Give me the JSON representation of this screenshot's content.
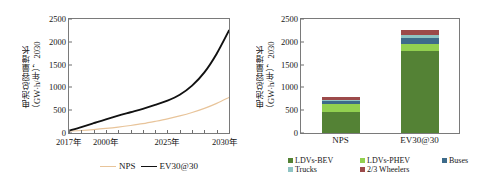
{
  "chart_data": [
    {
      "type": "line",
      "panel": "left",
      "title": "",
      "ylabel_line1": "电池总容量增长",
      "ylabel_line2": "（GW·h/年），2030",
      "xlabel": "",
      "ylim": [
        0,
        2500
      ],
      "yticks": [
        0,
        500,
        1000,
        1500,
        2000,
        2500
      ],
      "xlim": [
        2017,
        2030
      ],
      "xtick_labels": [
        "2017年",
        "2000年",
        "2025年",
        "2030年"
      ],
      "xtick_values": [
        2017,
        2020,
        2025,
        2030
      ],
      "grid": false,
      "legend_position": "bottom",
      "series": [
        {
          "name": "NPS",
          "color": "#e8c49a",
          "x": [
            2017,
            2018,
            2019,
            2020,
            2021,
            2022,
            2023,
            2024,
            2025,
            2026,
            2027,
            2028,
            2029,
            2030
          ],
          "values": [
            40,
            55,
            75,
            100,
            130,
            165,
            205,
            255,
            310,
            375,
            450,
            540,
            650,
            780
          ]
        },
        {
          "name": "EV30@30",
          "color": "#111111",
          "x": [
            2017,
            2018,
            2019,
            2020,
            2021,
            2022,
            2023,
            2024,
            2025,
            2026,
            2027,
            2028,
            2029,
            2030
          ],
          "values": [
            50,
            130,
            215,
            300,
            380,
            455,
            530,
            615,
            710,
            840,
            1040,
            1330,
            1740,
            2250
          ]
        }
      ]
    },
    {
      "type": "bar",
      "panel": "right",
      "stacked": true,
      "title": "",
      "ylabel_line1": "电池总容量增长",
      "ylabel_line2": "（GW·h/年），2030",
      "xlabel": "",
      "ylim": [
        0,
        2500
      ],
      "yticks": [
        0,
        500,
        1000,
        1500,
        2000,
        2500
      ],
      "categories": [
        "NPS",
        "EV30@30"
      ],
      "grid": false,
      "legend_position": "bottom",
      "series": [
        {
          "name": "LDVs-BEV",
          "color": "#548235",
          "values": [
            450,
            1790
          ]
        },
        {
          "name": "LDVs-PHEV",
          "color": "#92d050",
          "values": [
            185,
            170
          ]
        },
        {
          "name": "Buses",
          "color": "#3d6b8a",
          "values": [
            60,
            130
          ]
        },
        {
          "name": "Trucks",
          "color": "#8fc4c4",
          "values": [
            30,
            60
          ]
        },
        {
          "name": "2/3 Wheelers",
          "color": "#9c4a4a",
          "values": [
            55,
            105
          ]
        }
      ]
    }
  ],
  "left": {
    "ylabel_line1": "电池总容量增长",
    "ylabel_line2": "（GW·h/年），2030",
    "yticks": [
      "2500",
      "2000",
      "1500",
      "1000",
      "500",
      "0"
    ],
    "xticks": [
      "2017年",
      "2000年",
      "2025年",
      "2030年"
    ],
    "legend": [
      {
        "label": "NPS",
        "color": "#e8c49a"
      },
      {
        "label": "EV30@30",
        "color": "#111111"
      }
    ]
  },
  "right": {
    "ylabel_line1": "电池总容量增长",
    "ylabel_line2": "（GW·h/年），2030",
    "yticks": [
      "2500",
      "2000",
      "1500",
      "1000",
      "500",
      "0"
    ],
    "xticks": [
      "NPS",
      "EV30@30"
    ],
    "legend": [
      {
        "label": "LDVs-BEV",
        "color": "#548235"
      },
      {
        "label": "LDVs-PHEV",
        "color": "#92d050"
      },
      {
        "label": "Buses",
        "color": "#3d6b8a"
      },
      {
        "label": "Trucks",
        "color": "#8fc4c4"
      },
      {
        "label": "2/3 Wheelers",
        "color": "#9c4a4a"
      }
    ]
  }
}
